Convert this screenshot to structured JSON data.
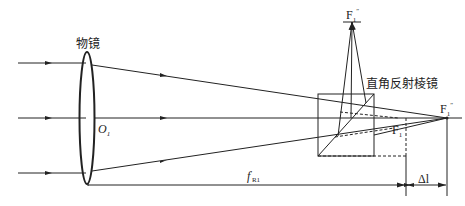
{
  "diagram": {
    "title_labels": {
      "objective": "物镜",
      "prism": "直角反射棱镜",
      "lens_center": "O",
      "lens_center_sub": "1",
      "focus_top": "F",
      "focus_top_sub": "1",
      "focus_top_sup": "″",
      "focus_right": "F",
      "focus_right_sub": "1",
      "focus_right_sup": "″",
      "focus_inner": "F",
      "focus_inner_sub": "1",
      "focus_inner_sup": "′",
      "focal_length": "f",
      "focal_length_sup": "′",
      "focal_length_sub": "R1",
      "delta": "Δl"
    },
    "colors": {
      "line": "#222222",
      "background": "#ffffff"
    }
  }
}
